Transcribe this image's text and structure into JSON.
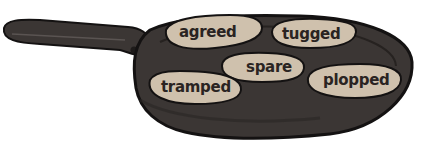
{
  "illustration": {
    "subject": "frying pan with sausages",
    "colors": {
      "pan": "#3b3634",
      "pan_outline": "#141212",
      "sausage": "#cfc1ad",
      "text": "#2a2422",
      "background": "#ffffff"
    },
    "sausages": [
      {
        "label": "agreed"
      },
      {
        "label": "tugged"
      },
      {
        "label": "spare"
      },
      {
        "label": "tramped"
      },
      {
        "label": "plopped"
      }
    ]
  }
}
